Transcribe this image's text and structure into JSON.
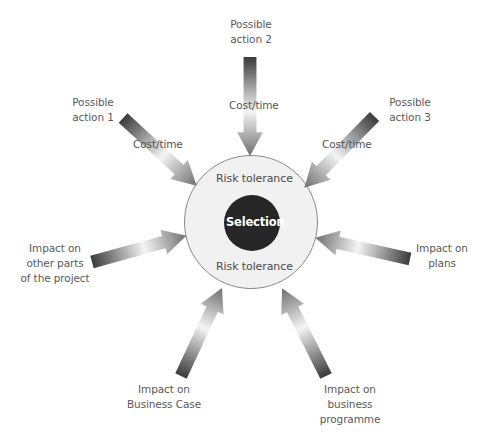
{
  "diagram": {
    "type": "radial-influence",
    "center": {
      "label": "Selection",
      "ring_top_label": "Risk tolerance",
      "ring_bottom_label": "Risk tolerance",
      "inner_color": "#262626",
      "ring_color": "#f1f1f1",
      "ring_stroke": "#8a8a8a"
    },
    "nodes": [
      {
        "id": "action1",
        "label": "Possible\naction 1",
        "edge_label": "Cost/time"
      },
      {
        "id": "action2",
        "label": "Possible\naction 2",
        "edge_label": "Cost/time"
      },
      {
        "id": "action3",
        "label": "Possible\naction 3",
        "edge_label": "Cost/time"
      },
      {
        "id": "other_parts",
        "label": "Impact on\nother parts\nof the project",
        "edge_label": ""
      },
      {
        "id": "plans",
        "label": "Impact on\nplans",
        "edge_label": ""
      },
      {
        "id": "business_case",
        "label": "Impact on\nBusiness Case",
        "edge_label": ""
      },
      {
        "id": "business_programme",
        "label": "Impact on\nbusiness\nprogramme",
        "edge_label": ""
      }
    ],
    "labels": {
      "action1_l1": "Possible",
      "action1_l2": "action 1",
      "action2_l1": "Possible",
      "action2_l2": "action 2",
      "action3_l1": "Possible",
      "action3_l2": "action 3",
      "other_l1": "Impact on",
      "other_l2": "other parts",
      "other_l3": "of the project",
      "plans_l1": "Impact on",
      "plans_l2": "plans",
      "bc_l1": "Impact on",
      "bc_l2": "Business Case",
      "bp_l1": "Impact on",
      "bp_l2": "business",
      "bp_l3": "programme",
      "cost1": "Cost/time",
      "cost2": "Cost/time",
      "cost3": "Cost/time"
    },
    "arrow_gradient": [
      "#3c3c3c",
      "#ffffff",
      "#6a6a6a"
    ]
  }
}
